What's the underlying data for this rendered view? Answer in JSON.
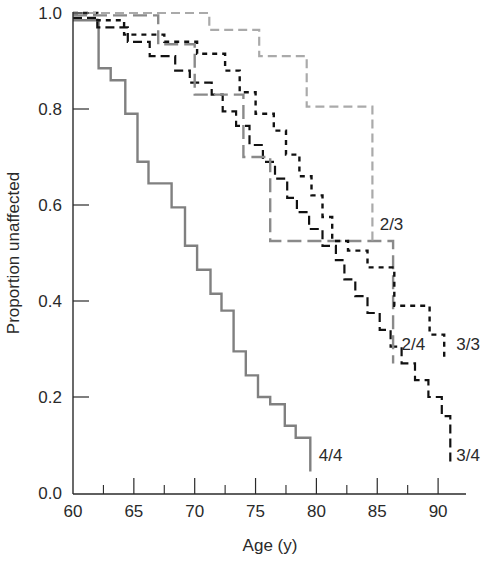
{
  "chart_data": {
    "type": "line",
    "subtype": "kaplan-meier-step",
    "title": "",
    "xlabel": "Age (y)",
    "ylabel": "Proportion unaffected",
    "xlim": [
      60,
      92
    ],
    "ylim": [
      0,
      1.0
    ],
    "x_ticks": [
      60,
      65,
      70,
      75,
      80,
      85,
      90
    ],
    "x_minor_ticks": [
      62.5,
      67.5,
      72.5,
      77.5,
      82.5,
      87.5
    ],
    "y_ticks": [
      "0.0",
      "0.2",
      "0.4",
      "0.6",
      "0.8",
      "1.0"
    ],
    "grid": false,
    "legend": "inline labels at curve ends",
    "series": [
      {
        "name": "4/4",
        "style": "solid",
        "color": "#808080",
        "points": [
          [
            60,
            0.985
          ],
          [
            62.1,
            0.985
          ],
          [
            62.1,
            0.885
          ],
          [
            63.1,
            0.885
          ],
          [
            63.1,
            0.86
          ],
          [
            64.3,
            0.86
          ],
          [
            64.3,
            0.79
          ],
          [
            65.3,
            0.79
          ],
          [
            65.3,
            0.69
          ],
          [
            66.2,
            0.69
          ],
          [
            66.2,
            0.645
          ],
          [
            68.1,
            0.645
          ],
          [
            68.1,
            0.595
          ],
          [
            69.2,
            0.595
          ],
          [
            69.2,
            0.515
          ],
          [
            70.2,
            0.515
          ],
          [
            70.2,
            0.465
          ],
          [
            71.3,
            0.465
          ],
          [
            71.3,
            0.415
          ],
          [
            72.2,
            0.415
          ],
          [
            72.2,
            0.38
          ],
          [
            73.2,
            0.38
          ],
          [
            73.2,
            0.295
          ],
          [
            74.2,
            0.295
          ],
          [
            74.2,
            0.245
          ],
          [
            75.2,
            0.245
          ],
          [
            75.2,
            0.2
          ],
          [
            76.2,
            0.2
          ],
          [
            76.2,
            0.185
          ],
          [
            77.4,
            0.185
          ],
          [
            77.4,
            0.14
          ],
          [
            78.3,
            0.14
          ],
          [
            78.3,
            0.115
          ],
          [
            79.5,
            0.115
          ],
          [
            79.5,
            0.045
          ]
        ]
      },
      {
        "name": "3/4",
        "style": "dashed",
        "color": "#111111",
        "points": [
          [
            60,
            0.99
          ],
          [
            62,
            0.99
          ],
          [
            62,
            0.97
          ],
          [
            64.5,
            0.97
          ],
          [
            64.5,
            0.94
          ],
          [
            66.3,
            0.94
          ],
          [
            66.3,
            0.91
          ],
          [
            68.4,
            0.91
          ],
          [
            68.4,
            0.88
          ],
          [
            69.6,
            0.88
          ],
          [
            69.6,
            0.855
          ],
          [
            71.4,
            0.855
          ],
          [
            71.4,
            0.83
          ],
          [
            72.3,
            0.83
          ],
          [
            72.3,
            0.795
          ],
          [
            73.4,
            0.795
          ],
          [
            73.4,
            0.765
          ],
          [
            74.5,
            0.765
          ],
          [
            74.5,
            0.725
          ],
          [
            75.6,
            0.725
          ],
          [
            75.6,
            0.69
          ],
          [
            76.6,
            0.69
          ],
          [
            76.6,
            0.655
          ],
          [
            77.6,
            0.655
          ],
          [
            77.6,
            0.615
          ],
          [
            78.4,
            0.615
          ],
          [
            78.4,
            0.585
          ],
          [
            79.4,
            0.585
          ],
          [
            79.4,
            0.55
          ],
          [
            80.5,
            0.55
          ],
          [
            80.5,
            0.515
          ],
          [
            81.6,
            0.515
          ],
          [
            81.6,
            0.485
          ],
          [
            82.3,
            0.485
          ],
          [
            82.3,
            0.445
          ],
          [
            83.2,
            0.445
          ],
          [
            83.2,
            0.41
          ],
          [
            84.2,
            0.41
          ],
          [
            84.2,
            0.375
          ],
          [
            85.2,
            0.375
          ],
          [
            85.2,
            0.34
          ],
          [
            86.1,
            0.34
          ],
          [
            86.1,
            0.305
          ],
          [
            87.0,
            0.305
          ],
          [
            87.0,
            0.27
          ],
          [
            88.1,
            0.27
          ],
          [
            88.1,
            0.235
          ],
          [
            89.2,
            0.235
          ],
          [
            89.2,
            0.2
          ],
          [
            90.3,
            0.2
          ],
          [
            90.3,
            0.16
          ],
          [
            91.0,
            0.16
          ],
          [
            91.0,
            0.115
          ],
          [
            91.0,
            0.055
          ]
        ]
      },
      {
        "name": "2/4",
        "style": "long-dashed",
        "color": "#8a8a8a",
        "points": [
          [
            60,
            0.995
          ],
          [
            67,
            0.995
          ],
          [
            67,
            0.935
          ],
          [
            70,
            0.935
          ],
          [
            70,
            0.83
          ],
          [
            74,
            0.83
          ],
          [
            74,
            0.7
          ],
          [
            76.2,
            0.7
          ],
          [
            76.2,
            0.525
          ],
          [
            86.3,
            0.525
          ],
          [
            86.3,
            0.27
          ]
        ]
      },
      {
        "name": "3/3",
        "style": "dotted-dashed",
        "color": "#111111",
        "points": [
          [
            60,
            1.0
          ],
          [
            62,
            1.0
          ],
          [
            62,
            0.985
          ],
          [
            64.2,
            0.985
          ],
          [
            64.2,
            0.955
          ],
          [
            67.5,
            0.955
          ],
          [
            67.5,
            0.94
          ],
          [
            70.2,
            0.94
          ],
          [
            70.2,
            0.915
          ],
          [
            72.5,
            0.915
          ],
          [
            72.5,
            0.88
          ],
          [
            73.7,
            0.88
          ],
          [
            73.7,
            0.835
          ],
          [
            75,
            0.835
          ],
          [
            75,
            0.79
          ],
          [
            76.5,
            0.79
          ],
          [
            76.5,
            0.755
          ],
          [
            77.5,
            0.755
          ],
          [
            77.5,
            0.705
          ],
          [
            78.6,
            0.705
          ],
          [
            78.6,
            0.66
          ],
          [
            79.6,
            0.66
          ],
          [
            79.6,
            0.62
          ],
          [
            80.5,
            0.62
          ],
          [
            80.5,
            0.575
          ],
          [
            81.3,
            0.575
          ],
          [
            81.3,
            0.525
          ],
          [
            82.6,
            0.525
          ],
          [
            82.6,
            0.505
          ],
          [
            84.2,
            0.505
          ],
          [
            84.2,
            0.47
          ],
          [
            86.4,
            0.47
          ],
          [
            86.4,
            0.39
          ],
          [
            89.3,
            0.39
          ],
          [
            89.3,
            0.33
          ],
          [
            90.5,
            0.33
          ],
          [
            90.5,
            0.275
          ]
        ]
      },
      {
        "name": "2/3",
        "style": "dashed",
        "color": "#aaaaaa",
        "points": [
          [
            60,
            1.0
          ],
          [
            71.2,
            1.0
          ],
          [
            71.2,
            0.965
          ],
          [
            75.3,
            0.965
          ],
          [
            75.3,
            0.91
          ],
          [
            79.2,
            0.91
          ],
          [
            79.2,
            0.805
          ],
          [
            84.6,
            0.805
          ],
          [
            84.6,
            0.525
          ]
        ]
      }
    ],
    "labels": [
      {
        "text": "2/3",
        "x": 85.2,
        "y": 0.56
      },
      {
        "text": "2/4",
        "x": 87.0,
        "y": 0.31
      },
      {
        "text": "3/3",
        "x": 91.5,
        "y": 0.31
      },
      {
        "text": "4/4",
        "x": 80.2,
        "y": 0.08
      },
      {
        "text": "3/4",
        "x": 91.5,
        "y": 0.08
      }
    ]
  },
  "axes": {
    "x_title": "Age (y)",
    "y_title": "Proportion unaffected"
  }
}
